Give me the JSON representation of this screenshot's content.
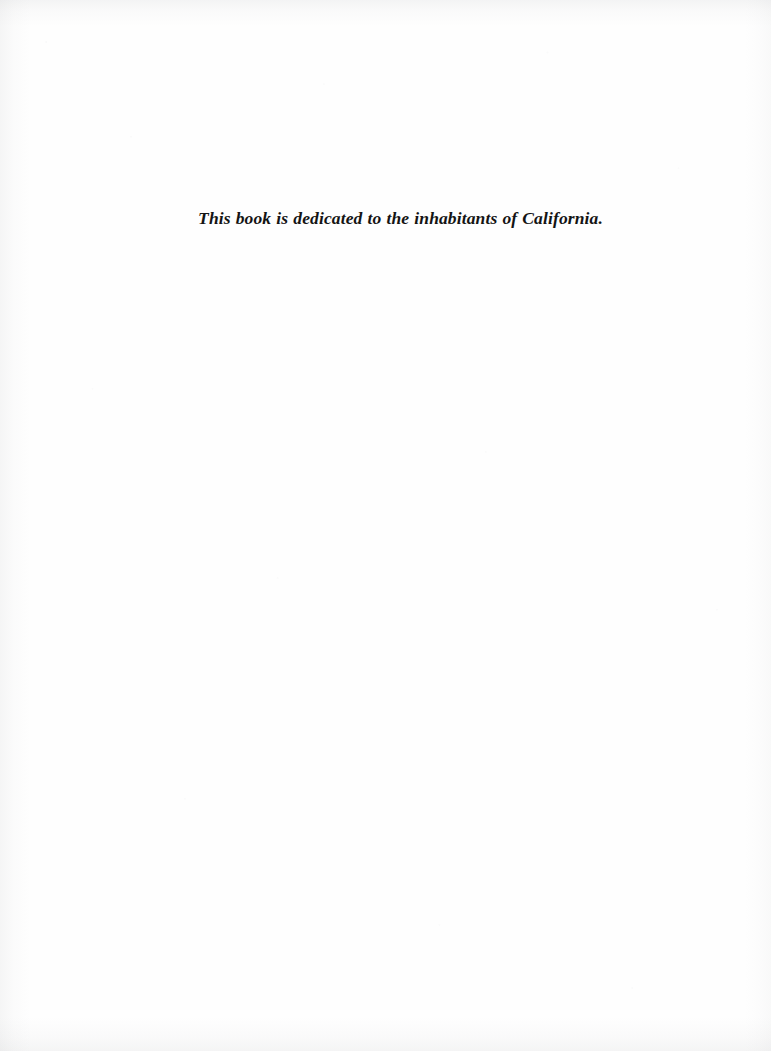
{
  "page": {
    "kind": "book-dedication-page",
    "background_color": "#ffffff",
    "paper_color": "#fefefe",
    "ink_color": "#141414",
    "width": 771,
    "height": 1051
  },
  "dedication": {
    "text": "This book is dedicated to the inhabitants of California.",
    "style": "italic-serif",
    "alignment": "center"
  }
}
